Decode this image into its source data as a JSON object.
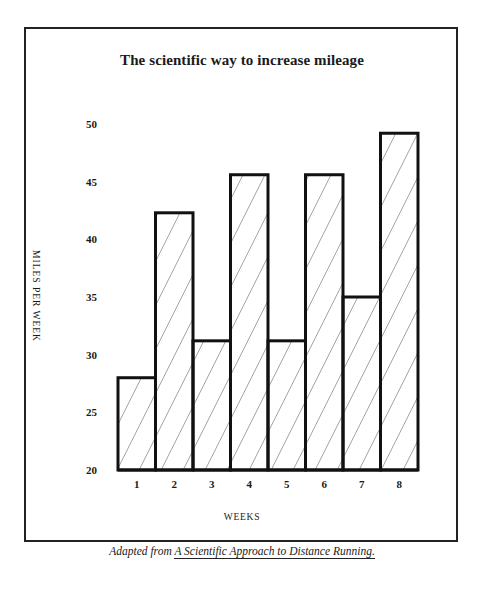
{
  "chart_data": {
    "type": "bar",
    "title": "The scientific way to increase mileage",
    "xlabel": "WEEKS",
    "ylabel": "MILES PER WEEK",
    "categories": [
      "1",
      "2",
      "3",
      "4",
      "5",
      "6",
      "7",
      "8"
    ],
    "values": [
      28,
      42.3,
      31.2,
      45.6,
      31.2,
      45.6,
      35,
      49.2
    ],
    "ylim": [
      20,
      50
    ],
    "yticks": [
      "20",
      "25",
      "30",
      "35",
      "40",
      "45",
      "50"
    ],
    "grid": false,
    "legend": null,
    "bar_style": "diagonal hatch, black outline, no gaps",
    "source_note": "Adapted from A Scientific Approach to Distance Running."
  },
  "source": {
    "prefix": "Adapted from ",
    "book_title": "A Scientific Approach to Distance Running."
  },
  "colors": {
    "ink": "#1a1a1a",
    "background": "#ffffff"
  }
}
